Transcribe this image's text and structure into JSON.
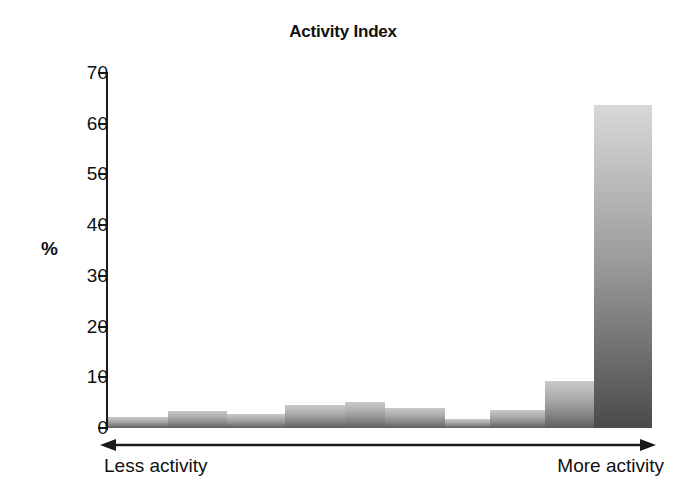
{
  "chart_data": {
    "type": "bar",
    "title": "Activity Index",
    "xlabel": "",
    "ylabel": "%",
    "ylim": [
      0,
      70
    ],
    "ytick_labels": [
      "70",
      "60",
      "50",
      "40",
      "30",
      "20",
      "10",
      "0"
    ],
    "yticks": [
      70,
      60,
      50,
      40,
      30,
      20,
      10,
      0
    ],
    "ytick_step": 10,
    "grid": false,
    "legend": null,
    "axis_annotations": {
      "left": "Less activity",
      "right": "More activity",
      "arrow": "double-headed"
    },
    "categories": [
      "1",
      "2",
      "3",
      "4",
      "5",
      "6",
      "7",
      "8",
      "9",
      "10"
    ],
    "values": [
      2.2,
      3.4,
      2.8,
      4.6,
      5.2,
      4.0,
      1.8,
      3.5,
      9.2,
      63.7
    ],
    "bars": [
      {
        "label": "1",
        "value": 2.2,
        "x_start_pct": 0.0,
        "width_pct": 11.03
      },
      {
        "label": "2",
        "value": 3.4,
        "x_start_pct": 11.03,
        "width_pct": 10.85
      },
      {
        "label": "3",
        "value": 2.8,
        "x_start_pct": 21.88,
        "width_pct": 10.66
      },
      {
        "label": "4",
        "value": 4.6,
        "x_start_pct": 32.54,
        "width_pct": 11.03
      },
      {
        "label": "5",
        "value": 5.2,
        "x_start_pct": 43.57,
        "width_pct": 7.35
      },
      {
        "label": "6",
        "value": 4.0,
        "x_start_pct": 50.92,
        "width_pct": 11.03
      },
      {
        "label": "7",
        "value": 1.8,
        "x_start_pct": 61.95,
        "width_pct": 8.27
      },
      {
        "label": "8",
        "value": 3.5,
        "x_start_pct": 70.22,
        "width_pct": 10.11
      },
      {
        "label": "9",
        "value": 9.2,
        "x_start_pct": 80.33,
        "width_pct": 9.01
      },
      {
        "label": "10",
        "value": 63.7,
        "x_start_pct": 89.34,
        "width_pct": 10.66
      }
    ],
    "colors": {
      "bar_gradient_top": "#d8d8d8",
      "bar_gradient_bottom": "#4a4a4a",
      "axis": "#1a1a1a",
      "text": "#111111",
      "background": "#ffffff"
    }
  }
}
